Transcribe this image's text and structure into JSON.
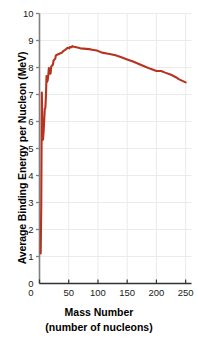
{
  "chart_data": {
    "type": "line",
    "title": "",
    "xlabel": "Mass Number",
    "xlabel_sub": "(number of nucleons)",
    "ylabel": "Average Binding Energy per  Nucleon (MeV)",
    "xlim": [
      0,
      260
    ],
    "ylim": [
      0,
      10
    ],
    "xticks": [
      0,
      50,
      100,
      150,
      200,
      250
    ],
    "xtick_labels": [
      "0",
      "50",
      "100",
      "150",
      "200",
      "250"
    ],
    "yticks": [
      0,
      1,
      2,
      3,
      4,
      5,
      6,
      7,
      8,
      9,
      10
    ],
    "ytick_labels": [
      "0",
      "1",
      "2",
      "3",
      "4",
      "5",
      "6",
      "7",
      "8",
      "9",
      "10"
    ],
    "grid": true,
    "grid_color": "#ebebeb",
    "axis_color": "#808080",
    "line_color": "#b5331f",
    "line_width": 2.1,
    "legend": null,
    "series": [
      {
        "name": "Binding energy per nucleon",
        "x": [
          2,
          3,
          4,
          5,
          6,
          7,
          9,
          10,
          11,
          12,
          13,
          14,
          15,
          16,
          18,
          19,
          20,
          23,
          24,
          27,
          28,
          31,
          32,
          35,
          39,
          40,
          45,
          48,
          51,
          52,
          55,
          56,
          59,
          63,
          70,
          75,
          80,
          85,
          90,
          98,
          107,
          115,
          120,
          130,
          140,
          150,
          160,
          170,
          180,
          190,
          200,
          208,
          215,
          225,
          235,
          238,
          250
        ],
        "y": [
          1.11,
          2.83,
          7.07,
          5.33,
          5.33,
          5.61,
          6.46,
          6.5,
          6.93,
          7.68,
          7.47,
          7.52,
          7.7,
          7.98,
          7.77,
          7.78,
          8.03,
          8.11,
          8.26,
          8.33,
          8.45,
          8.48,
          8.49,
          8.52,
          8.56,
          8.6,
          8.67,
          8.73,
          8.71,
          8.76,
          8.75,
          8.79,
          8.77,
          8.75,
          8.71,
          8.7,
          8.69,
          8.68,
          8.66,
          8.63,
          8.55,
          8.52,
          8.5,
          8.45,
          8.38,
          8.3,
          8.22,
          8.13,
          8.04,
          7.95,
          7.87,
          7.87,
          7.81,
          7.73,
          7.62,
          7.57,
          7.45
        ]
      }
    ]
  }
}
